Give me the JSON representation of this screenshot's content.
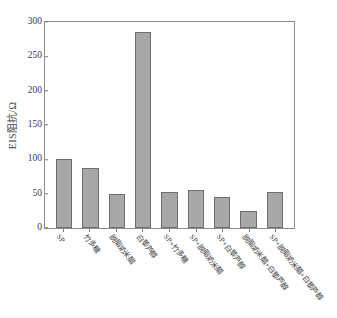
{
  "chart_data": {
    "type": "bar",
    "title": "",
    "subtitle": "",
    "xlabel": "",
    "ylabel": "EIS阻抗/Ω",
    "ylim": [
      0,
      300
    ],
    "yticks": [
      0,
      50,
      100,
      150,
      200,
      250,
      300
    ],
    "grid": false,
    "legend": null,
    "bar_color": "#a8a8a8",
    "bar_edge_color": "#6e6e6e",
    "axis_color": "#8d8d8d",
    "categories": [
      "SP",
      "竹多糖",
      "脱脂奶米醋",
      "白藜芦醇",
      "SP+竹多糖",
      "SP+脱脂奶米醋",
      "SP+白藜芦醇",
      "脱脂奶米醋+白藜芦醇",
      "SP+脱脂奶米醋+白藜芦醇"
    ],
    "values": [
      100,
      88,
      50,
      286,
      53,
      56,
      45,
      25,
      52
    ],
    "series": [
      {
        "name": "EIS阻抗",
        "values": [
          100,
          88,
          50,
          286,
          53,
          56,
          45,
          25,
          52
        ]
      }
    ]
  }
}
